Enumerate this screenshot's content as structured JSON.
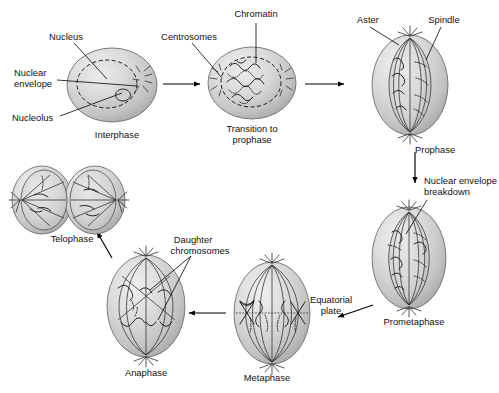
{
  "figure": {
    "background_color": "#ffffff",
    "text_color": "#111111",
    "cell_fill_light": "#e4e4e4",
    "cell_fill_mid": "#c9c9c9",
    "cell_fill_dark": "#a9a9a9",
    "outline_color": "#6f6f6f"
  },
  "stages": [
    {
      "id": "interphase",
      "label": "Interphase"
    },
    {
      "id": "transition",
      "label": "Transition to"
    },
    {
      "id": "transition2",
      "label": "prophase"
    },
    {
      "id": "prophase",
      "label": "Prophase"
    },
    {
      "id": "prometaphase",
      "label": "Prometaphase"
    },
    {
      "id": "metaphase",
      "label": "Metaphase"
    },
    {
      "id": "anaphase",
      "label": "Anaphase"
    },
    {
      "id": "telophase",
      "label": "Telophase"
    }
  ],
  "callouts": [
    {
      "id": "nucleus",
      "label": "Nucleus"
    },
    {
      "id": "nuclear-envelope-1",
      "label": "Nuclear"
    },
    {
      "id": "nuclear-envelope-2",
      "label": "envelope"
    },
    {
      "id": "nucleolus",
      "label": "Nucleolus"
    },
    {
      "id": "centrosomes",
      "label": "Centrosomes"
    },
    {
      "id": "chromatin",
      "label": "Chromatin"
    },
    {
      "id": "aster",
      "label": "Aster"
    },
    {
      "id": "spindle",
      "label": "Spindle"
    },
    {
      "id": "nuclear-envelope-breakdown-1",
      "label": "Nuclear envelope"
    },
    {
      "id": "nuclear-envelope-breakdown-2",
      "label": "breakdown"
    },
    {
      "id": "equatorial-plate-1",
      "label": "Equatorial"
    },
    {
      "id": "equatorial-plate-2",
      "label": "plate"
    },
    {
      "id": "daughter-chromosomes-1",
      "label": "Daughter"
    },
    {
      "id": "daughter-chromosomes-2",
      "label": "chromosomes"
    }
  ],
  "labels": {
    "interphase": "Interphase",
    "transition_line1": "Transition to",
    "transition_line2": "prophase",
    "prophase": "Prophase",
    "prometaphase": "Prometaphase",
    "metaphase": "Metaphase",
    "anaphase": "Anaphase",
    "telophase": "Telophase",
    "nucleus": "Nucleus",
    "nuclear_envelope_line1": "Nuclear",
    "nuclear_envelope_line2": "envelope",
    "nucleolus": "Nucleolus",
    "centrosomes": "Centrosomes",
    "chromatin": "Chromatin",
    "aster": "Aster",
    "spindle": "Spindle",
    "neb_line1": "Nuclear envelope",
    "neb_line2": "breakdown",
    "equatorial_line1": "Equatorial",
    "equatorial_line2": "plate",
    "daughter_line1": "Daughter",
    "daughter_line2": "chromosomes"
  }
}
